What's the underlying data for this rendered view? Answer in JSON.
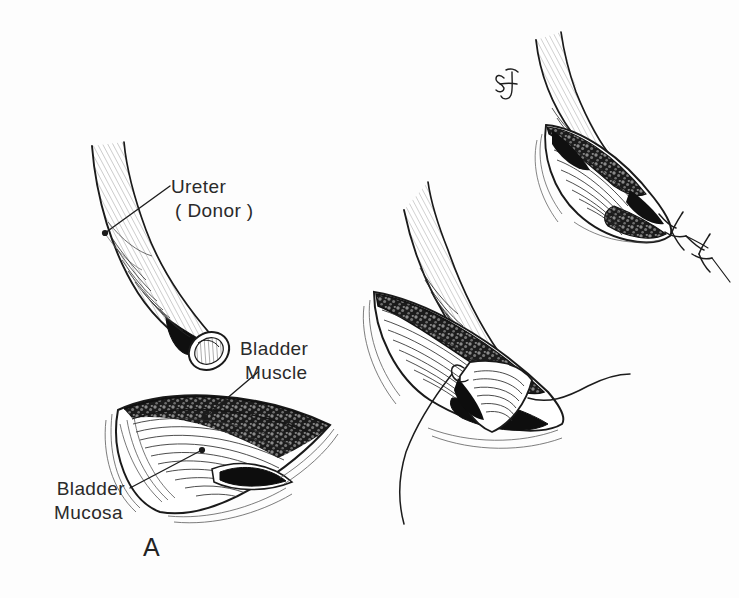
{
  "figure": {
    "background_color": "#fdfdfd",
    "ink_color": "#1a1a1a",
    "label_color": "#2a2a2a",
    "fill_dark": "#111111",
    "fill_stipple": "#4a4a4a",
    "medium": "pen-and-ink line drawing"
  },
  "labels": {
    "ureter": {
      "line1": "Ureter",
      "line2": "( Donor )"
    },
    "bladder_muscle": {
      "line1": "Bladder",
      "line2": "Muscle"
    },
    "bladder_mucosa": {
      "line1": "Bladder",
      "line2": "Mucosa"
    },
    "panel_letter": "A",
    "artist_monogram": "SJ"
  },
  "panels": [
    {
      "id": "panel-a",
      "letter": "A",
      "description": "Spatulated donor ureter above an elliptical bladder incision showing muscle and mucosa layers",
      "callouts": [
        "Ureter ( Donor )",
        "Bladder Muscle",
        "Bladder Mucosa"
      ]
    },
    {
      "id": "panel-middle",
      "letter": "",
      "description": "Donor ureter tip drawn into the bladder opening with anchoring suture threads",
      "callouts": []
    },
    {
      "id": "panel-top-right",
      "letter": "",
      "description": "Completed anastomosis with ureter seated in the bladder and two tied suture knots",
      "callouts": []
    }
  ]
}
